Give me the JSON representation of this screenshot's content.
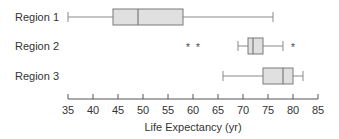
{
  "chart_data": {
    "type": "boxplot",
    "orientation": "horizontal",
    "title": "",
    "xlabel": "Life Expectancy (yr)",
    "ylabel": "",
    "xlim": [
      35,
      85
    ],
    "x_ticks": [
      35,
      40,
      45,
      50,
      55,
      60,
      65,
      70,
      75,
      80,
      85
    ],
    "grid": false,
    "legend": null,
    "categories": [
      "Region 1",
      "Region 2",
      "Region 3"
    ],
    "series": [
      {
        "name": "Region 1",
        "whisker_low": 35,
        "q1": 44,
        "median": 49,
        "q3": 58,
        "whisker_high": 76,
        "outliers": []
      },
      {
        "name": "Region 2",
        "whisker_low": 69,
        "q1": 71,
        "median": 72,
        "q3": 74,
        "whisker_high": 78,
        "outliers": [
          59,
          61,
          80
        ]
      },
      {
        "name": "Region 3",
        "whisker_low": 66,
        "q1": 74,
        "median": 78,
        "q3": 80,
        "whisker_high": 82,
        "outliers": []
      }
    ],
    "outlier_marker": "*",
    "colors": {
      "box_fill": "#e0e0e0",
      "box_stroke": "#7a7a7a",
      "whisker": "#8a8a8a",
      "axis": "#555555",
      "text": "#333333"
    }
  }
}
